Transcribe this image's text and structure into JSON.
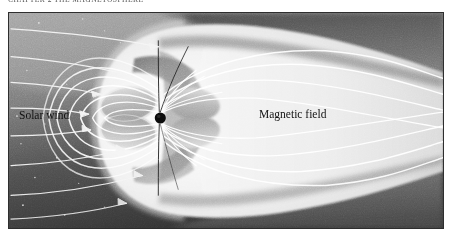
{
  "page": {
    "width": 454,
    "height": 240,
    "background": "#ffffff"
  },
  "running_head": {
    "text": "CHAPTER 2  THE MAGNETOSPHERE",
    "note": "clipped at top edge of screenshot; only glyph bottoms visible",
    "visible": true
  },
  "figure": {
    "kind": "scientific-illustration",
    "frame": {
      "x": 8,
      "y": 12,
      "width": 436,
      "height": 217,
      "border_color": "#2e2e2e"
    },
    "labels": [
      {
        "id": "solar-wind",
        "text": "Solar wind",
        "x": 10,
        "y": 96,
        "color": "#121212"
      },
      {
        "id": "magnetic-field",
        "text": "Magnetic field",
        "x": 250,
        "y": 95,
        "color": "#121212"
      }
    ],
    "palette": {
      "space_dark": "#3a3a3a",
      "space_mid": "#6f6f6f",
      "space_light": "#8f8f8f",
      "sheath_bright": "#ececec",
      "sheath_white": "#f7f7f7",
      "lobe_grey": "#b9b9b9",
      "shadow_grey": "#8b8b8b",
      "field_line": "#ffffff",
      "cusp_line": "#161616",
      "earth": "#0b0b0b",
      "frame": "#2e2e2e"
    },
    "elements": {
      "earth": {
        "cx": 152,
        "cy": 104,
        "r": 5.5,
        "color": "#0b0b0b"
      },
      "solar_wind_arrows": 7,
      "dayside_field_lines": 7,
      "tail_field_lines": 8,
      "polar_cusp_lines": 2,
      "bow_shock": true,
      "magnetopause": true,
      "magnetotail": true
    }
  }
}
